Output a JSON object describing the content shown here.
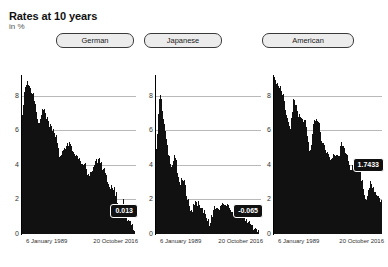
{
  "header": {
    "title": "Rates at 10 years",
    "subtitle": "in %"
  },
  "tabs": [
    {
      "label": "German",
      "selected": false
    },
    {
      "label": "Japanese",
      "selected": false
    },
    {
      "label": "American",
      "selected": false
    }
  ],
  "colors": {
    "series": "#111111",
    "gridline": "#b9b9b9",
    "badge_background": "#111111",
    "badge_text": "#ffffff",
    "tab_background": "#ececec",
    "tab_border": "#3a3a3a"
  },
  "chart_data": [
    {
      "type": "area",
      "title": "German",
      "xlabel": "",
      "ylabel": "in %",
      "ylim": [
        0,
        9.2
      ],
      "yticks": [
        0,
        2,
        4,
        6,
        8
      ],
      "grid": true,
      "legend": "none",
      "x_tick_labels": [
        "6 January 1989",
        "20 October 2016"
      ],
      "last_value_label": "0.013",
      "last_value": 0.013,
      "x": [
        "1989",
        "1990",
        "1991",
        "1992",
        "1993",
        "1994",
        "1995",
        "1996",
        "1997",
        "1998",
        "1999",
        "2000",
        "2001",
        "2002",
        "2003",
        "2004",
        "2005",
        "2006",
        "2007",
        "2008",
        "2009",
        "2010",
        "2011",
        "2012",
        "2013",
        "2014",
        "2015",
        "2016"
      ],
      "values": [
        6.9,
        8.8,
        8.4,
        7.8,
        6.3,
        7.2,
        6.6,
        6.2,
        5.6,
        4.4,
        4.9,
        5.2,
        4.8,
        4.5,
        4.1,
        4.0,
        3.3,
        3.9,
        4.3,
        4.0,
        3.3,
        2.8,
        2.6,
        1.5,
        1.8,
        0.9,
        0.6,
        0.013
      ]
    },
    {
      "type": "area",
      "title": "Japanese",
      "xlabel": "",
      "ylabel": "in %",
      "ylim": [
        0,
        9.2
      ],
      "yticks": [
        0,
        2,
        4,
        6,
        8
      ],
      "grid": true,
      "legend": "none",
      "x_tick_labels": [
        "6 January 1989",
        "20 October 2016"
      ],
      "last_value_label": "-0.065",
      "last_value": -0.065,
      "x": [
        "1989",
        "1990",
        "1991",
        "1992",
        "1993",
        "1994",
        "1995",
        "1996",
        "1997",
        "1998",
        "1999",
        "2000",
        "2001",
        "2002",
        "2003",
        "2004",
        "2005",
        "2006",
        "2007",
        "2008",
        "2009",
        "2010",
        "2011",
        "2012",
        "2013",
        "2014",
        "2015",
        "2016"
      ],
      "values": [
        4.7,
        7.9,
        6.4,
        5.0,
        4.0,
        4.4,
        3.0,
        3.2,
        2.3,
        1.3,
        1.8,
        1.7,
        1.4,
        1.0,
        0.6,
        1.6,
        1.4,
        1.8,
        1.7,
        1.5,
        1.3,
        1.2,
        1.1,
        0.8,
        0.7,
        0.4,
        0.3,
        -0.065
      ]
    },
    {
      "type": "area",
      "title": "American",
      "xlabel": "",
      "ylabel": "in %",
      "ylim": [
        0,
        9.2
      ],
      "yticks": [
        0,
        2,
        4,
        6,
        8
      ],
      "grid": true,
      "legend": "none",
      "x_tick_labels": [
        "6 January 1989",
        "20 October 2016"
      ],
      "last_value_label": "1.7433",
      "last_value": 1.7433,
      "x": [
        "1989",
        "1990",
        "1991",
        "1992",
        "1993",
        "1994",
        "1995",
        "1996",
        "1997",
        "1998",
        "1999",
        "2000",
        "2001",
        "2002",
        "2003",
        "2004",
        "2005",
        "2006",
        "2007",
        "2008",
        "2009",
        "2010",
        "2011",
        "2012",
        "2013",
        "2014",
        "2015",
        "2016"
      ],
      "values": [
        9.0,
        8.6,
        8.3,
        7.3,
        6.0,
        7.8,
        7.0,
        6.7,
        6.4,
        4.7,
        6.4,
        6.6,
        5.4,
        5.0,
        4.2,
        4.6,
        4.5,
        5.2,
        4.7,
        3.9,
        3.9,
        3.7,
        3.2,
        1.9,
        3.0,
        2.5,
        2.3,
        1.7433
      ]
    }
  ]
}
